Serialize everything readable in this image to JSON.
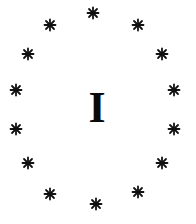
{
  "card": {
    "numeral": "I",
    "symbol": "asterisk",
    "symbol_color": "#111111",
    "background": "#ffffff",
    "stars": [
      {
        "x": 93,
        "y": 13
      },
      {
        "x": 138,
        "y": 25
      },
      {
        "x": 162,
        "y": 54
      },
      {
        "x": 174,
        "y": 90
      },
      {
        "x": 174,
        "y": 129
      },
      {
        "x": 162,
        "y": 163
      },
      {
        "x": 138,
        "y": 192
      },
      {
        "x": 96,
        "y": 204
      },
      {
        "x": 50,
        "y": 194
      },
      {
        "x": 28,
        "y": 163
      },
      {
        "x": 16,
        "y": 129
      },
      {
        "x": 16,
        "y": 90
      },
      {
        "x": 28,
        "y": 54
      },
      {
        "x": 50,
        "y": 25
      }
    ]
  }
}
